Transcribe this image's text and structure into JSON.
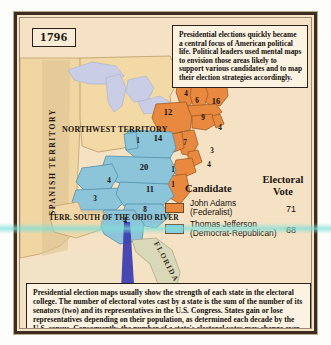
{
  "map": {
    "year": "1796",
    "title_label": "1796",
    "note": "Presidential elections quickly became a central focus of American political life. Political leaders used mental maps to envision those areas likely to support various candidates and to map their election strategies accordingly.",
    "caption": "Presidential election maps usually show the strength of each state in the electoral college. The number of electoral votes cast by a state is the sum of the number of its senators (two) and its representatives in the U.S. Congress. States gain or lose representatives depending on their population, as determined each decade by the U.S. census. Consequently, the number of a state's electoral votes may change over time.",
    "territories": {
      "spanish": "SPANISH TERRITORY",
      "northwest": "NORTHWEST TERRITORY",
      "terr_south": "TERR. SOUTH OF THE OHIO RIVER",
      "florida": "FLORIDA"
    }
  },
  "legend": {
    "header_candidate": "Candidate",
    "header_electoral": "Electoral",
    "header_vote": "Vote",
    "entries": [
      {
        "name": "John Adams",
        "party": "(Federalist)",
        "votes": "71",
        "color": "#e9883f"
      },
      {
        "name": "Thomas Jefferson",
        "party": "(Democrat-Republican)",
        "votes": "68",
        "color": "#8cc4da"
      }
    ]
  },
  "colors": {
    "adams_orange": "#e9883f",
    "jefferson_blue": "#8cc4da",
    "land_tan": "#f2d8a8",
    "lakes": "#c9cee6",
    "paper": "#f5e2c4",
    "border": "#3c2d20",
    "scan_teal": "#7edfd9"
  },
  "electoral_numbers": [
    {
      "id": "vermont",
      "value": "4",
      "x": 166,
      "y": 76,
      "color": "dark"
    },
    {
      "id": "new-hampshire",
      "value": "6",
      "x": 177,
      "y": 83,
      "color": "dark"
    },
    {
      "id": "massachusetts",
      "value": "16",
      "x": 196,
      "y": 84,
      "color": "dark"
    },
    {
      "id": "new-york",
      "value": "12",
      "x": 148,
      "y": 95,
      "color": "dark"
    },
    {
      "id": "connecticut",
      "value": "9",
      "x": 183,
      "y": 100,
      "color": "dark"
    },
    {
      "id": "rhode-island",
      "value": "4",
      "x": 200,
      "y": 110,
      "color": "dark"
    },
    {
      "id": "pennsylvania",
      "value": "14",
      "x": 138,
      "y": 121,
      "color": "dark"
    },
    {
      "id": "new-jersey",
      "value": "7",
      "x": 165,
      "y": 125,
      "color": "dark"
    },
    {
      "id": "vermont-west",
      "value": "1",
      "x": 118,
      "y": 123,
      "color": "dark"
    },
    {
      "id": "delaware",
      "value": "3",
      "x": 192,
      "y": 133,
      "color": "dark"
    },
    {
      "id": "maryland-a",
      "value": "4",
      "x": 189,
      "y": 147,
      "color": "dark"
    },
    {
      "id": "virginia",
      "value": "20",
      "x": 124,
      "y": 150,
      "color": "dark"
    },
    {
      "id": "maryland-b",
      "value": "1",
      "x": 153,
      "y": 152,
      "color": "dark"
    },
    {
      "id": "kentucky",
      "value": "4",
      "x": 89,
      "y": 163,
      "color": "dark"
    },
    {
      "id": "north-carolina",
      "value": "11",
      "x": 130,
      "y": 172,
      "color": "dark"
    },
    {
      "id": "nc-coast",
      "value": "1",
      "x": 153,
      "y": 167,
      "color": "dark"
    },
    {
      "id": "tennessee",
      "value": "3",
      "x": 75,
      "y": 181,
      "color": "dark"
    },
    {
      "id": "south-carolina",
      "value": "8",
      "x": 125,
      "y": 192,
      "color": "dark"
    },
    {
      "id": "georgia",
      "value": "4",
      "x": 105,
      "y": 203,
      "color": "dark"
    }
  ]
}
